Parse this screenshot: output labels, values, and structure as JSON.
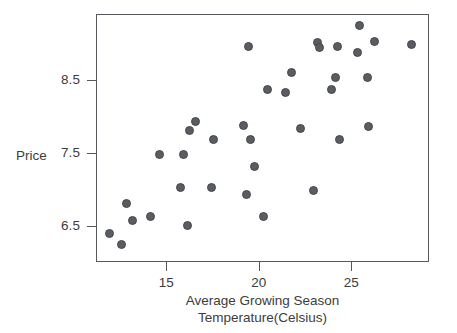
{
  "chart_data": {
    "type": "scatter",
    "title": "",
    "xlabel": "Average Growing Season Temperature(Celsius)",
    "xlabel_line1": "Average Growing Season",
    "xlabel_line2": "Temperature(Celsius)",
    "ylabel": "Price",
    "xticks": [
      15,
      20,
      25
    ],
    "xtick_labels": [
      "15",
      "20",
      "25"
    ],
    "yticks": [
      6.5,
      7.5,
      8.5
    ],
    "ytick_labels": [
      "6.5",
      "7.5",
      "8.5"
    ],
    "xlim": [
      11.2,
      29.2
    ],
    "ylim": [
      6.0,
      9.4
    ],
    "grid": false,
    "legend": null,
    "marker": "circle",
    "marker_color": "#595c61",
    "frame_color": "#55585c",
    "background": "#ffffff",
    "n_points": 38,
    "points": [
      {
        "x": 11.9,
        "y": 6.41
      },
      {
        "x": 12.5,
        "y": 6.26
      },
      {
        "x": 12.8,
        "y": 6.82
      },
      {
        "x": 13.1,
        "y": 6.58
      },
      {
        "x": 14.1,
        "y": 6.64
      },
      {
        "x": 14.6,
        "y": 7.49
      },
      {
        "x": 15.7,
        "y": 7.03
      },
      {
        "x": 15.9,
        "y": 7.49
      },
      {
        "x": 16.1,
        "y": 6.52
      },
      {
        "x": 16.2,
        "y": 7.81
      },
      {
        "x": 16.5,
        "y": 7.94
      },
      {
        "x": 17.4,
        "y": 7.03
      },
      {
        "x": 17.5,
        "y": 7.69
      },
      {
        "x": 19.1,
        "y": 7.88
      },
      {
        "x": 19.4,
        "y": 8.97
      },
      {
        "x": 19.5,
        "y": 7.69
      },
      {
        "x": 19.7,
        "y": 7.32
      },
      {
        "x": 19.3,
        "y": 6.94
      },
      {
        "x": 20.2,
        "y": 6.64
      },
      {
        "x": 20.4,
        "y": 8.38
      },
      {
        "x": 21.4,
        "y": 8.34
      },
      {
        "x": 21.7,
        "y": 8.61
      },
      {
        "x": 22.2,
        "y": 7.85
      },
      {
        "x": 22.9,
        "y": 6.99
      },
      {
        "x": 23.1,
        "y": 9.02
      },
      {
        "x": 23.2,
        "y": 8.96
      },
      {
        "x": 23.9,
        "y": 8.38
      },
      {
        "x": 24.1,
        "y": 8.55
      },
      {
        "x": 24.2,
        "y": 8.97
      },
      {
        "x": 24.3,
        "y": 7.69
      },
      {
        "x": 25.3,
        "y": 8.88
      },
      {
        "x": 25.4,
        "y": 9.26
      },
      {
        "x": 25.8,
        "y": 8.54
      },
      {
        "x": 25.9,
        "y": 7.87
      },
      {
        "x": 26.2,
        "y": 9.03
      },
      {
        "x": 28.2,
        "y": 9.0
      }
    ]
  },
  "figure": {
    "alt_description": "Scatter plot of wine Price versus Average Growing Season Temperature in Celsius showing a positive association"
  }
}
